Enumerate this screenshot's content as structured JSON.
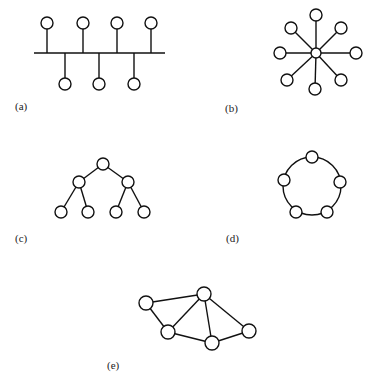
{
  "figure": {
    "node_radius": 6,
    "stroke_color": "#111111",
    "background": "#ffffff"
  },
  "panels": [
    {
      "id": "a",
      "label": "(a)",
      "topology": "bus",
      "label_pos": [
        15,
        101
      ],
      "bus": [
        34,
        53,
        165,
        53
      ],
      "nodes": [
        [
          47,
          23
        ],
        [
          83,
          23
        ],
        [
          117,
          23
        ],
        [
          151,
          23
        ],
        [
          65,
          84
        ],
        [
          99,
          84
        ],
        [
          134,
          84
        ]
      ],
      "edges": [
        [
          [
            47,
            29
          ],
          [
            47,
            53
          ]
        ],
        [
          [
            83,
            29
          ],
          [
            83,
            53
          ]
        ],
        [
          [
            117,
            29
          ],
          [
            117,
            53
          ]
        ],
        [
          [
            151,
            29
          ],
          [
            151,
            53
          ]
        ],
        [
          [
            65,
            53
          ],
          [
            65,
            78
          ]
        ],
        [
          [
            99,
            53
          ],
          [
            99,
            78
          ]
        ],
        [
          [
            134,
            53
          ],
          [
            134,
            78
          ]
        ]
      ]
    },
    {
      "id": "b",
      "label": "(b)",
      "topology": "star",
      "label_pos": [
        225,
        103
      ],
      "hub": [
        316,
        53
      ],
      "hub_radius": 5,
      "nodes": [
        [
          316,
          15
        ],
        [
          341,
          28
        ],
        [
          356,
          53
        ],
        [
          341,
          80
        ],
        [
          315,
          89
        ],
        [
          287,
          80
        ],
        [
          280,
          53
        ],
        [
          291,
          28
        ]
      ]
    },
    {
      "id": "c",
      "label": "(c)",
      "topology": "tree",
      "label_pos": [
        15,
        233
      ],
      "nodes": [
        [
          103,
          164
        ],
        [
          79,
          182
        ],
        [
          128,
          182
        ],
        [
          61,
          212
        ],
        [
          88,
          212
        ],
        [
          116,
          212
        ],
        [
          144,
          212
        ]
      ],
      "edges": [
        [
          0,
          1
        ],
        [
          0,
          2
        ],
        [
          1,
          3
        ],
        [
          1,
          4
        ],
        [
          2,
          5
        ],
        [
          2,
          6
        ]
      ]
    },
    {
      "id": "d",
      "label": "(d)",
      "topology": "ring",
      "label_pos": [
        226,
        233
      ],
      "ring_center": [
        312,
        186
      ],
      "ring_radius": 29,
      "nodes": [
        [
          312,
          157
        ],
        [
          340,
          182
        ],
        [
          327,
          212
        ],
        [
          296,
          212
        ],
        [
          284,
          180
        ]
      ]
    },
    {
      "id": "e",
      "label": "(e)",
      "topology": "mesh",
      "label_pos": [
        107,
        360
      ],
      "nodes": [
        [
          146,
          303
        ],
        [
          204,
          294
        ],
        [
          168,
          332
        ],
        [
          212,
          343
        ],
        [
          249,
          331
        ]
      ],
      "edges": [
        [
          0,
          1
        ],
        [
          0,
          2
        ],
        [
          1,
          2
        ],
        [
          1,
          3
        ],
        [
          1,
          4
        ],
        [
          2,
          3
        ],
        [
          3,
          4
        ]
      ]
    }
  ]
}
